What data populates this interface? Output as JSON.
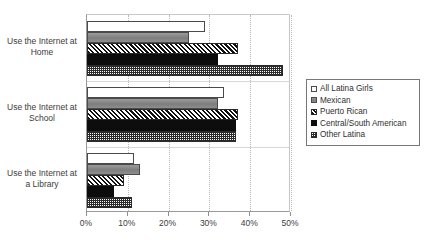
{
  "chart_data": {
    "type": "bar",
    "orientation": "horizontal",
    "title": "",
    "subtitle": "",
    "xlabel": "",
    "ylabel": "",
    "xlim": [
      0,
      50
    ],
    "xtick_labels": [
      "0%",
      "10%",
      "20%",
      "30%",
      "40%",
      "50%"
    ],
    "xtick_values": [
      0,
      10,
      20,
      30,
      40,
      50
    ],
    "grid": "vertical-dotted",
    "legend_position": "right",
    "categories": [
      "Use the Internet at Home",
      "Use the Internet at School",
      "Use the Internet at a Library"
    ],
    "category_lines": [
      [
        "Use the Internet at",
        "Home"
      ],
      [
        "Use the Internet at",
        "School"
      ],
      [
        "Use the Internet at",
        "a Library"
      ]
    ],
    "series": [
      {
        "name": "All Latina Girls",
        "pattern": "open-white",
        "values": [
          29,
          33.5,
          11.5
        ]
      },
      {
        "name": "Mexican",
        "pattern": "solid-gray",
        "values": [
          25,
          32,
          13
        ]
      },
      {
        "name": "Puerto Rican",
        "pattern": "diagonal-hatch",
        "values": [
          37,
          37,
          9
        ]
      },
      {
        "name": "Central/South American",
        "pattern": "solid-black",
        "values": [
          32,
          36.5,
          6.5
        ]
      },
      {
        "name": "Other Latina",
        "pattern": "dotted",
        "values": [
          48,
          36.5,
          11
        ]
      }
    ]
  },
  "legend": {
    "items": [
      {
        "label": "All Latina Girls"
      },
      {
        "label": "Mexican"
      },
      {
        "label": "Puerto Rican"
      },
      {
        "label": "Central/South American"
      },
      {
        "label": "Other Latina"
      }
    ]
  },
  "colors": {
    "axis": "#9a9a9a",
    "grid": "#b9b9b9",
    "text": "#3c3c3c",
    "series_gray": "#878787",
    "series_black": "#0d0d0d",
    "background": "#ffffff"
  }
}
